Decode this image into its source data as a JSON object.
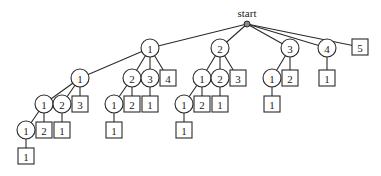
{
  "diagram": {
    "type": "tree",
    "root": {
      "id": "start",
      "label": "start",
      "x": 247,
      "y": 24
    },
    "node_radius": 9,
    "square_size": 16,
    "nodes": [
      {
        "id": "n1",
        "label": "1",
        "shape": "circle",
        "x": 150,
        "y": 48,
        "parent": "start"
      },
      {
        "id": "n2",
        "label": "2",
        "shape": "circle",
        "x": 220,
        "y": 48,
        "parent": "start"
      },
      {
        "id": "n3",
        "label": "3",
        "shape": "circle",
        "x": 290,
        "y": 48,
        "parent": "start"
      },
      {
        "id": "n4",
        "label": "4",
        "shape": "circle",
        "x": 327,
        "y": 48,
        "parent": "start"
      },
      {
        "id": "n5",
        "label": "5",
        "shape": "square",
        "x": 360,
        "y": 47,
        "parent": "start"
      },
      {
        "id": "n1_1",
        "label": "1",
        "shape": "circle",
        "x": 80,
        "y": 78,
        "parent": "n1"
      },
      {
        "id": "n1_2",
        "label": "2",
        "shape": "circle",
        "x": 132,
        "y": 78,
        "parent": "n1"
      },
      {
        "id": "n1_3",
        "label": "3",
        "shape": "circle",
        "x": 150,
        "y": 78,
        "parent": "n1"
      },
      {
        "id": "n1_4",
        "label": "4",
        "shape": "square",
        "x": 168,
        "y": 78,
        "parent": "n1"
      },
      {
        "id": "n1_1_1",
        "label": "1",
        "shape": "circle",
        "x": 44,
        "y": 104,
        "parent": "n1_1"
      },
      {
        "id": "n1_1_2",
        "label": "2",
        "shape": "circle",
        "x": 62,
        "y": 104,
        "parent": "n1_1"
      },
      {
        "id": "n1_1_3",
        "label": "3",
        "shape": "square",
        "x": 80,
        "y": 104,
        "parent": "n1_1"
      },
      {
        "id": "n1_1_1_1",
        "label": "1",
        "shape": "circle",
        "x": 26,
        "y": 130,
        "parent": "n1_1_1"
      },
      {
        "id": "n1_1_1_2",
        "label": "2",
        "shape": "square",
        "x": 44,
        "y": 130,
        "parent": "n1_1_1"
      },
      {
        "id": "n1_1_2_1",
        "label": "1",
        "shape": "square",
        "x": 62,
        "y": 130,
        "parent": "n1_1_2"
      },
      {
        "id": "n1_1_1_1_1",
        "label": "1",
        "shape": "square",
        "x": 26,
        "y": 156,
        "parent": "n1_1_1_1"
      },
      {
        "id": "n1_2_1",
        "label": "1",
        "shape": "circle",
        "x": 114,
        "y": 104,
        "parent": "n1_2"
      },
      {
        "id": "n1_2_2",
        "label": "2",
        "shape": "square",
        "x": 132,
        "y": 104,
        "parent": "n1_2"
      },
      {
        "id": "n1_3_1",
        "label": "1",
        "shape": "square",
        "x": 150,
        "y": 104,
        "parent": "n1_3"
      },
      {
        "id": "n1_2_1_1",
        "label": "1",
        "shape": "square",
        "x": 114,
        "y": 130,
        "parent": "n1_2_1"
      },
      {
        "id": "n2_1",
        "label": "1",
        "shape": "circle",
        "x": 202,
        "y": 78,
        "parent": "n2"
      },
      {
        "id": "n2_2",
        "label": "2",
        "shape": "circle",
        "x": 220,
        "y": 78,
        "parent": "n2"
      },
      {
        "id": "n2_3",
        "label": "3",
        "shape": "square",
        "x": 238,
        "y": 78,
        "parent": "n2"
      },
      {
        "id": "n2_1_1",
        "label": "1",
        "shape": "circle",
        "x": 184,
        "y": 104,
        "parent": "n2_1"
      },
      {
        "id": "n2_1_2",
        "label": "2",
        "shape": "square",
        "x": 202,
        "y": 104,
        "parent": "n2_1"
      },
      {
        "id": "n2_2_1",
        "label": "1",
        "shape": "square",
        "x": 220,
        "y": 104,
        "parent": "n2_2"
      },
      {
        "id": "n2_1_1_1",
        "label": "1",
        "shape": "square",
        "x": 184,
        "y": 130,
        "parent": "n2_1_1"
      },
      {
        "id": "n3_1",
        "label": "1",
        "shape": "circle",
        "x": 272,
        "y": 78,
        "parent": "n3"
      },
      {
        "id": "n3_2",
        "label": "2",
        "shape": "square",
        "x": 290,
        "y": 78,
        "parent": "n3"
      },
      {
        "id": "n3_1_1",
        "label": "1",
        "shape": "square",
        "x": 272,
        "y": 104,
        "parent": "n3_1"
      },
      {
        "id": "n4_1",
        "label": "1",
        "shape": "square",
        "x": 327,
        "y": 78,
        "parent": "n4"
      }
    ]
  }
}
